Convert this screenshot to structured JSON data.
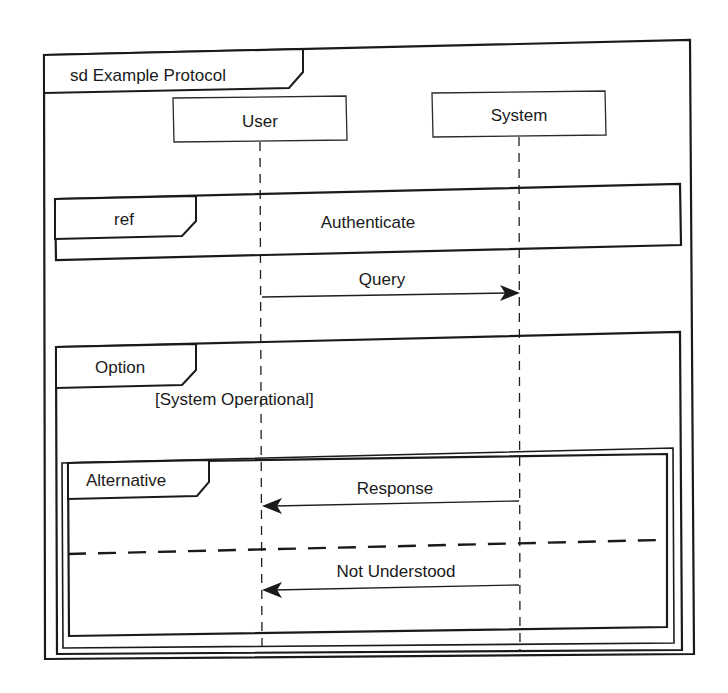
{
  "diagram": {
    "type": "UML sequence diagram",
    "frame": {
      "label": "sd Example Protocol"
    },
    "lifelines": [
      {
        "id": "user",
        "label": "User"
      },
      {
        "id": "system",
        "label": "System"
      }
    ],
    "ref_fragment": {
      "operator": "ref",
      "label": "Authenticate"
    },
    "messages": [
      {
        "label": "Query",
        "from": "User",
        "to": "System"
      },
      {
        "label": "Response",
        "from": "System",
        "to": "User"
      },
      {
        "label": "Not Understood",
        "from": "System",
        "to": "User"
      }
    ],
    "option_fragment": {
      "operator": "Option",
      "guard": "[System Operational]"
    },
    "alternative_fragment": {
      "operator": "Alternative"
    },
    "colors": {
      "ink": "#1a1a1a",
      "background": "#ffffff"
    }
  }
}
